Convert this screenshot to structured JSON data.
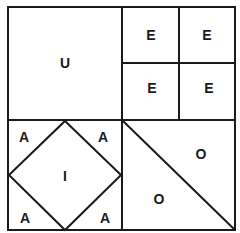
{
  "diagram": {
    "title": "",
    "stroke_color": "#1a1a1a",
    "background": "#ffffff",
    "regions": {
      "top_left": {
        "label": "U"
      },
      "top_right": {
        "cells": [
          {
            "label": "E"
          },
          {
            "label": "E"
          },
          {
            "label": "E"
          },
          {
            "label": "E"
          }
        ]
      },
      "bottom_left": {
        "center_label": "I",
        "corners": [
          {
            "label": "A"
          },
          {
            "label": "A"
          },
          {
            "label": "A"
          },
          {
            "label": "A"
          }
        ]
      },
      "bottom_right": {
        "triangles": [
          {
            "label": "O"
          },
          {
            "label": "O"
          }
        ]
      }
    }
  }
}
